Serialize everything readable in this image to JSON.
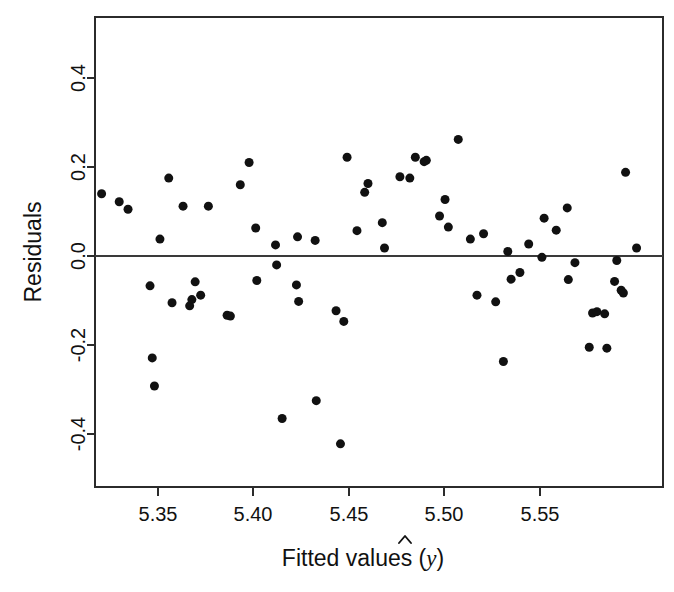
{
  "chart_data": {
    "type": "scatter",
    "title": "",
    "xlabel": "Fitted values (ŷ)",
    "ylabel": "Residuals",
    "xlabel_parts": {
      "text": "Fitted values (",
      "symbol": "ŷ",
      "close": ")"
    },
    "xlim": [
      5.3195,
      5.5775
    ],
    "ylim": [
      -0.519,
      0.537
    ],
    "xticks": [
      5.35,
      5.4,
      5.45,
      5.5,
      5.55
    ],
    "xticklabels": [
      "5.35",
      "5.40",
      "5.45",
      "5.50",
      "5.55"
    ],
    "yticks": [
      0.4,
      0.2,
      0.0,
      -0.2,
      -0.4
    ],
    "yticklabels": [
      "0.4",
      "0.2",
      "0.0",
      "-0.2",
      "-0.4"
    ],
    "grid": false,
    "legend": null,
    "reference_lines": [
      {
        "name": "zero-residual-line",
        "orientation": "horizontal",
        "y": 0.0
      }
    ],
    "marker": {
      "shape": "circle",
      "color": "#111111",
      "size_px": 4.6
    },
    "n_points": 82,
    "points": [
      {
        "x": 5.3225,
        "y": 0.14
      },
      {
        "x": 5.3305,
        "y": 0.122
      },
      {
        "x": 5.3345,
        "y": 0.105
      },
      {
        "x": 5.3445,
        "y": -0.067
      },
      {
        "x": 5.3455,
        "y": -0.229
      },
      {
        "x": 5.3465,
        "y": -0.292
      },
      {
        "x": 5.349,
        "y": 0.038
      },
      {
        "x": 5.353,
        "y": 0.175
      },
      {
        "x": 5.3545,
        "y": -0.105
      },
      {
        "x": 5.3595,
        "y": 0.112
      },
      {
        "x": 5.3625,
        "y": -0.112
      },
      {
        "x": 5.3635,
        "y": -0.098
      },
      {
        "x": 5.365,
        "y": -0.058
      },
      {
        "x": 5.3675,
        "y": -0.088
      },
      {
        "x": 5.371,
        "y": 0.112
      },
      {
        "x": 5.3795,
        "y": -0.133
      },
      {
        "x": 5.381,
        "y": -0.135
      },
      {
        "x": 5.3855,
        "y": 0.16
      },
      {
        "x": 5.3895,
        "y": 0.21
      },
      {
        "x": 5.3925,
        "y": 0.063
      },
      {
        "x": 5.393,
        "y": -0.055
      },
      {
        "x": 5.4015,
        "y": 0.025
      },
      {
        "x": 5.402,
        "y": -0.02
      },
      {
        "x": 5.4045,
        "y": -0.365
      },
      {
        "x": 5.411,
        "y": -0.065
      },
      {
        "x": 5.4115,
        "y": 0.043
      },
      {
        "x": 5.412,
        "y": -0.102
      },
      {
        "x": 5.4195,
        "y": 0.035
      },
      {
        "x": 5.42,
        "y": -0.325
      },
      {
        "x": 5.429,
        "y": -0.123
      },
      {
        "x": 5.431,
        "y": -0.422
      },
      {
        "x": 5.4325,
        "y": -0.147
      },
      {
        "x": 5.434,
        "y": 0.222
      },
      {
        "x": 5.4385,
        "y": 0.057
      },
      {
        "x": 5.442,
        "y": 0.143
      },
      {
        "x": 5.4435,
        "y": 0.163
      },
      {
        "x": 5.45,
        "y": 0.075
      },
      {
        "x": 5.451,
        "y": 0.018
      },
      {
        "x": 5.458,
        "y": 0.178
      },
      {
        "x": 5.4625,
        "y": 0.175
      },
      {
        "x": 5.465,
        "y": 0.222
      },
      {
        "x": 5.469,
        "y": 0.212
      },
      {
        "x": 5.47,
        "y": 0.215
      },
      {
        "x": 5.476,
        "y": 0.09
      },
      {
        "x": 5.4785,
        "y": 0.127
      },
      {
        "x": 5.48,
        "y": 0.065
      },
      {
        "x": 5.4845,
        "y": 0.262
      },
      {
        "x": 5.49,
        "y": 0.038
      },
      {
        "x": 5.493,
        "y": -0.088
      },
      {
        "x": 5.496,
        "y": 0.05
      },
      {
        "x": 5.5015,
        "y": -0.103
      },
      {
        "x": 5.505,
        "y": -0.237
      },
      {
        "x": 5.507,
        "y": 0.01
      },
      {
        "x": 5.5085,
        "y": -0.052
      },
      {
        "x": 5.5125,
        "y": -0.037
      },
      {
        "x": 5.5165,
        "y": 0.027
      },
      {
        "x": 5.5225,
        "y": -0.003
      },
      {
        "x": 5.5235,
        "y": 0.085
      },
      {
        "x": 5.529,
        "y": 0.058
      },
      {
        "x": 5.534,
        "y": 0.108
      },
      {
        "x": 5.5345,
        "y": -0.053
      },
      {
        "x": 5.5375,
        "y": -0.015
      },
      {
        "x": 5.544,
        "y": -0.205
      },
      {
        "x": 5.5455,
        "y": -0.128
      },
      {
        "x": 5.5475,
        "y": -0.125
      },
      {
        "x": 5.551,
        "y": -0.13
      },
      {
        "x": 5.552,
        "y": -0.207
      },
      {
        "x": 5.5555,
        "y": -0.057
      },
      {
        "x": 5.5565,
        "y": -0.01
      },
      {
        "x": 5.5585,
        "y": -0.077
      },
      {
        "x": 5.5595,
        "y": -0.083
      },
      {
        "x": 5.5605,
        "y": 0.188
      },
      {
        "x": 5.5655,
        "y": 0.018
      }
    ]
  },
  "axes": {
    "y_title": "Residuals",
    "x_title_prefix": "Fitted values (",
    "x_title_symbol": "y",
    "x_title_suffix": ")"
  }
}
